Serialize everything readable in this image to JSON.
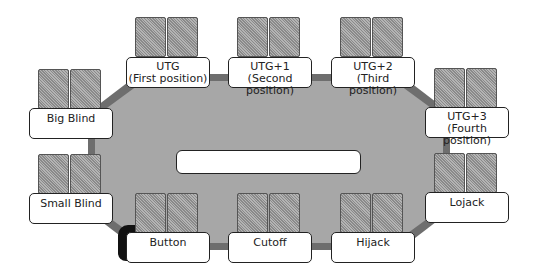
{
  "diagram": {
    "center_label": "",
    "colors": {
      "felt": "#a7a7a7",
      "rail": "#6e6e6e",
      "card_back": "#9a9a9a",
      "label_bg": "#ffffff",
      "border": "#222222"
    },
    "seats": [
      {
        "id": "utg",
        "line1": "UTG",
        "line2": "(First position)"
      },
      {
        "id": "utg1",
        "line1": "UTG+1",
        "line2": "(Second position)"
      },
      {
        "id": "utg2",
        "line1": "UTG+2",
        "line2": "(Third position)"
      },
      {
        "id": "utg3",
        "line1": "UTG+3",
        "line2": "(Fourth position)"
      },
      {
        "id": "big-blind",
        "line1": "Big Blind",
        "line2": ""
      },
      {
        "id": "small-blind",
        "line1": "Small Blind",
        "line2": ""
      },
      {
        "id": "lojack",
        "line1": "Lojack",
        "line2": ""
      },
      {
        "id": "button",
        "line1": "Button",
        "line2": ""
      },
      {
        "id": "cutoff",
        "line1": "Cutoff",
        "line2": ""
      },
      {
        "id": "hijack",
        "line1": "Hijack",
        "line2": ""
      }
    ]
  }
}
